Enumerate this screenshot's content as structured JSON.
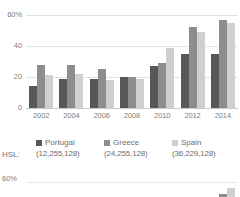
{
  "chart_data": {
    "type": "bar",
    "title": "",
    "xlabel": "",
    "ylabel": "",
    "ylim": [
      0,
      60
    ],
    "yticks": [
      "0",
      "20",
      "40",
      "60%"
    ],
    "ytick_values": [
      0,
      20,
      40,
      60
    ],
    "grid": true,
    "legend_position": "bottom",
    "categories": [
      "2002",
      "2004",
      "2006",
      "2008",
      "2010",
      "2012",
      "2014"
    ],
    "series": [
      {
        "name": "Portugal",
        "color": "#575757",
        "hsl": "(12,255,128)",
        "values": [
          14,
          19,
          19,
          20,
          27,
          35,
          35
        ]
      },
      {
        "name": "Greece",
        "color": "#8d8d8d",
        "hsl": "(24,255,128)",
        "values": [
          28,
          28,
          25,
          20,
          29,
          52,
          57
        ]
      },
      {
        "name": "Spain",
        "color": "#cfcfcf",
        "hsl": "(36,229,128)",
        "values": [
          21,
          22,
          18,
          19,
          39,
          49,
          55
        ]
      }
    ]
  },
  "legend": {
    "hsl_prefix": "HSL:",
    "items": [
      {
        "label": "Portugal",
        "value": "(12,255,128)"
      },
      {
        "label": "Greece",
        "value": "(24,255,128)"
      },
      {
        "label": "Spain",
        "value": "(36,229,128)"
      }
    ]
  },
  "chart2": {
    "ytick_top": "60%",
    "series_colors": [
      "#575757",
      "#8d8d8d",
      "#cfcfcf"
    ],
    "visible_bars": [
      {
        "group": 6,
        "values": [
          0,
          3,
          9
        ]
      }
    ]
  }
}
